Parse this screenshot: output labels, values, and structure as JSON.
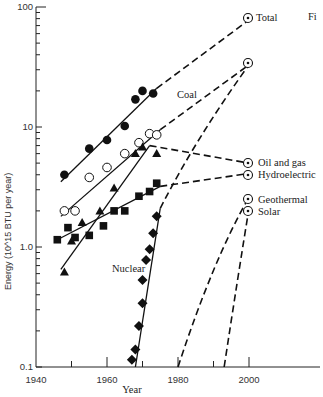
{
  "chart_data": {
    "type": "line",
    "title": "",
    "corner_label": "Fi",
    "xlabel": "Year",
    "ylabel": "Energy (10^15 BTU per year)",
    "yscale": "log",
    "xlim": [
      1940,
      2020
    ],
    "ylim": [
      0.1,
      100
    ],
    "x_ticks": [
      1940,
      1960,
      1980,
      2000
    ],
    "x_tick_labels": [
      "1940",
      "1960",
      "1980",
      "2000"
    ],
    "y_ticks": [
      0.1,
      1.0,
      10,
      100
    ],
    "y_tick_labels": [
      "0.1",
      "1.0",
      "10",
      "100"
    ],
    "series": [
      {
        "name": "Total",
        "marker": "filled-circle",
        "points": [
          [
            1948,
            4.0
          ],
          [
            1955,
            6.6
          ],
          [
            1960,
            7.8
          ],
          [
            1965,
            10.2
          ],
          [
            1968,
            17.0
          ],
          [
            1970,
            20.0
          ],
          [
            1973,
            19.0
          ]
        ],
        "fit": [
          [
            1947,
            3.5
          ],
          [
            1974,
            21
          ]
        ],
        "projection": [
          [
            1974,
            21
          ],
          [
            2000,
            78
          ]
        ],
        "projection_marker_2000": 78
      },
      {
        "name": "Coal",
        "marker": "open-circle",
        "points": [
          [
            1948,
            2.0
          ],
          [
            1951,
            2.0
          ],
          [
            1955,
            3.8
          ],
          [
            1960,
            4.6
          ],
          [
            1965,
            6.0
          ],
          [
            1969,
            7.4
          ],
          [
            1972,
            8.8
          ],
          [
            1974,
            8.6
          ]
        ],
        "fit": [
          [
            1947,
            1.8
          ],
          [
            1975,
            9.5
          ]
        ],
        "projection": [
          [
            1975,
            9.5
          ],
          [
            2000,
            33
          ]
        ],
        "projection_marker_2000": 33
      },
      {
        "name": "Oil and gas",
        "marker": "filled-triangle",
        "points": [
          [
            1948,
            0.62
          ],
          [
            1950,
            1.12
          ],
          [
            1953,
            1.6
          ],
          [
            1958,
            2.0
          ],
          [
            1962,
            3.1
          ],
          [
            1968,
            6.0
          ],
          [
            1970,
            6.8
          ],
          [
            1974,
            6.0
          ]
        ],
        "fit": [
          [
            1947,
            0.65
          ],
          [
            1972,
            7.0
          ]
        ],
        "projection": [
          [
            1972,
            7.0
          ],
          [
            2000,
            5.0
          ]
        ],
        "projection_marker_2000": 5.0
      },
      {
        "name": "Hydroelectric",
        "marker": "filled-square",
        "points": [
          [
            1946,
            1.15
          ],
          [
            1949,
            1.45
          ],
          [
            1951,
            1.2
          ],
          [
            1955,
            1.25
          ],
          [
            1959,
            1.5
          ],
          [
            1962,
            2.0
          ],
          [
            1965,
            2.0
          ],
          [
            1969,
            2.65
          ],
          [
            1972,
            2.9
          ],
          [
            1974,
            3.4
          ]
        ],
        "fit": [
          [
            1946,
            1.15
          ],
          [
            1975,
            3.2
          ]
        ],
        "projection": [
          [
            1975,
            3.2
          ],
          [
            2000,
            4.1
          ]
        ],
        "projection_marker_2000": 4.1
      },
      {
        "name": "Nuclear",
        "marker": "filled-diamond",
        "points": [
          [
            1967,
            0.115
          ],
          [
            1968,
            0.14
          ],
          [
            1969,
            0.22
          ],
          [
            1970,
            0.34
          ],
          [
            1970,
            0.53
          ],
          [
            1971,
            0.78
          ],
          [
            1972,
            0.96
          ],
          [
            1973,
            1.3
          ],
          [
            1974,
            1.8
          ]
        ],
        "fit": [
          [
            1968,
            0.1
          ],
          [
            1975,
            2.1
          ]
        ],
        "projection": [
          [
            1975,
            2.1
          ],
          [
            1985,
            8
          ],
          [
            2000,
            33
          ]
        ],
        "projection_marker_2000": 33
      },
      {
        "name": "Geothermal",
        "marker": "none",
        "points": [],
        "projection": [
          [
            1980,
            0.1
          ],
          [
            1990,
            0.8
          ],
          [
            2000,
            2.6
          ]
        ],
        "projection_marker_2000": 2.6
      },
      {
        "name": "Solar",
        "marker": "none",
        "points": [],
        "projection": [
          [
            1993,
            0.1
          ],
          [
            1997,
            0.6
          ],
          [
            2000,
            2.1
          ]
        ],
        "projection_marker_2000": 2.1
      }
    ],
    "legend": "inline labels at right (projected 2000 values marked with circled dot)",
    "grid": false
  }
}
